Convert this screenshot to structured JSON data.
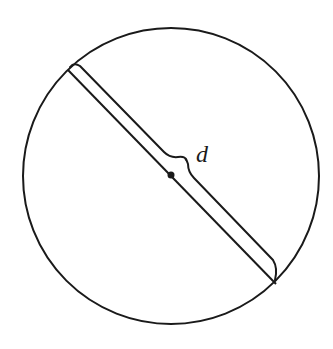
{
  "diagram": {
    "title": "",
    "circle": {
      "cx": 171,
      "cy": 176,
      "r": 148,
      "stroke": "#1a1a1a"
    },
    "diameter": {
      "x1": 68,
      "y1": 70,
      "x2": 276,
      "y2": 284
    },
    "center_point": {
      "cx": 171,
      "cy": 175
    },
    "brace_label": "d",
    "stroke_color": "#1a1a1a",
    "background": "#ffffff"
  }
}
